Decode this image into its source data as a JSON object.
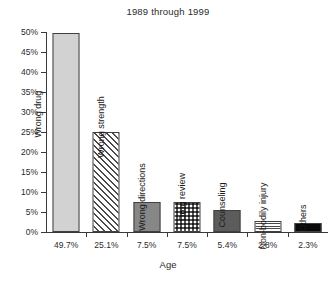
{
  "chart_data": {
    "type": "bar",
    "title": "1989 through 1999",
    "xlabel": "Age",
    "ylabel": "",
    "ylim": [
      0,
      50
    ],
    "grid": false,
    "legend": "none",
    "categories": [
      "Wrong drug",
      "Wrong strength",
      "Wrong directions",
      "Drug review",
      "Counseling",
      "Non-bodily injury",
      "Others"
    ],
    "values": [
      49.7,
      25.1,
      7.5,
      7.5,
      5.4,
      2.8,
      2.3
    ],
    "x_tick_labels": [
      "49.7%",
      "25.1%",
      "7.5%",
      "7.5%",
      "5.4%",
      "2.8%",
      "2.3%"
    ],
    "y_tick_labels": [
      "0%",
      "5%",
      "10%",
      "15%",
      "20%",
      "25%",
      "30%",
      "35%",
      "40%",
      "45%",
      "50%"
    ],
    "y_tick_values": [
      0,
      5,
      10,
      15,
      20,
      25,
      30,
      35,
      40,
      45,
      50
    ],
    "bar_fills": [
      "solid-light-gray",
      "diagonal-hatch",
      "solid-medium-gray",
      "dotted-grid",
      "solid-dark-gray",
      "horizontal-hatch",
      "solid-black"
    ],
    "label_placement": [
      "inside",
      "above",
      "above",
      "above",
      "above",
      "above",
      "above"
    ],
    "colors": {
      "solid-light-gray": "#d2d2d2",
      "solid-medium-gray": "#878787",
      "solid-dark-gray": "#5c5c5c",
      "solid-black": "#0a0a0a",
      "hatch-line": "#4a4a4a",
      "bar-outline": "#404040",
      "axis": "#3a3a3a",
      "text": "#1a1a1a"
    }
  },
  "caption": {
    "text": ""
  }
}
